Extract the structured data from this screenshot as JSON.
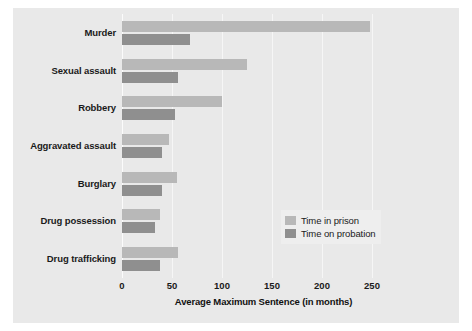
{
  "chart_data": {
    "type": "bar",
    "orientation": "horizontal",
    "title": "",
    "xlabel": "Average Maximum Sentence (in months)",
    "ylabel": "",
    "xlim": [
      0,
      283
    ],
    "xticks": [
      0,
      50,
      100,
      150,
      200,
      250
    ],
    "xticklabels": [
      "0",
      "50",
      "100",
      "150",
      "200",
      "250"
    ],
    "grid": true,
    "legend_position": "center-right-inside",
    "categories": [
      "Murder",
      "Sexual assault",
      "Robbery",
      "Aggravated assault",
      "Burglary",
      "Drug possession",
      "Drug trafficking"
    ],
    "series": [
      {
        "name": "Time in prison",
        "color": "#b8b8b8",
        "values": [
          248,
          125,
          100,
          47,
          55,
          38,
          56
        ]
      },
      {
        "name": "Time on probation",
        "color": "#8f8f8f",
        "values": [
          68,
          56,
          53,
          40,
          40,
          33,
          38
        ]
      }
    ]
  },
  "legend": {
    "items": [
      {
        "label": "Time in prison",
        "color": "#b8b8b8"
      },
      {
        "label": "Time on probation",
        "color": "#8f8f8f"
      }
    ]
  },
  "colors": {
    "page_background": "#ffffff",
    "panel_background": "#e9e9e9",
    "gridline": "#f6f6f6",
    "text": "#1a1a1a",
    "prison": "#b8b8b8",
    "probation": "#8f8f8f"
  }
}
